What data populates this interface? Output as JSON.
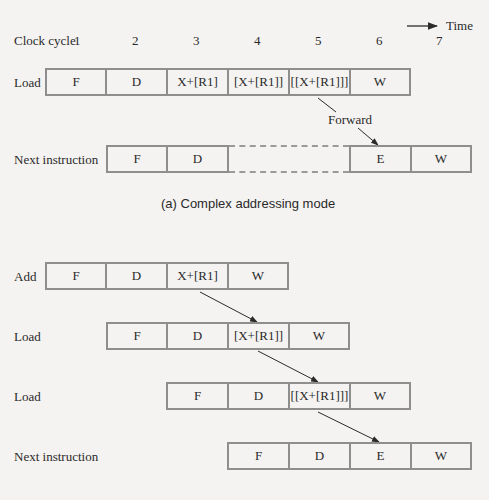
{
  "header": {
    "running_head": ""
  },
  "time_axis": {
    "label": "Time",
    "clock_label": "Clock cycle",
    "cycles": [
      "1",
      "2",
      "3",
      "4",
      "5",
      "6",
      "7"
    ]
  },
  "diagram_a": {
    "caption": "(a) Complex addressing mode",
    "rows": [
      {
        "label": "Load",
        "stages": [
          "F",
          "D",
          "X+[R1]",
          "[X+[R1]]",
          "[[X+[R1]]]",
          "W"
        ]
      },
      {
        "label": "Next instruction",
        "stages": [
          "F",
          "D",
          "E",
          "W"
        ]
      }
    ],
    "forward_label": "Forward"
  },
  "diagram_b": {
    "rows": [
      {
        "label": "Add",
        "stages": [
          "F",
          "D",
          "X+[R1]",
          "W"
        ]
      },
      {
        "label": "Load",
        "stages": [
          "F",
          "D",
          "[X+[R1]]",
          "W"
        ]
      },
      {
        "label": "Load",
        "stages": [
          "F",
          "D",
          "[[X+[R1]]]",
          "W"
        ]
      },
      {
        "label": "Next instruction",
        "stages": [
          "F",
          "D",
          "E",
          "W"
        ]
      }
    ]
  },
  "colors": {
    "box_border": "#8e8e8e",
    "arrow": "#2a2a2a",
    "background": "#f4f3f1"
  }
}
